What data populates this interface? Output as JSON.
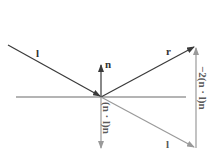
{
  "diagram": {
    "labels": {
      "incident": "l",
      "normal": "n",
      "reflected": "r",
      "projection": "(n · l)n",
      "incident_copy": "l",
      "double_projection": "−2(n · l)n"
    },
    "colors": {
      "primary": "#3a3a3a",
      "secondary": "#9a9a9a",
      "surface": "#6a6a6a",
      "background": "#ffffff"
    },
    "geometry": {
      "origin": [
        101,
        97
      ],
      "surface": {
        "x1": 16,
        "x2": 186,
        "y": 97
      },
      "incident_start": [
        8,
        45
      ],
      "normal_tip": [
        101,
        65
      ],
      "reflected_tip": [
        194,
        47
      ],
      "projection_tip": [
        101,
        148
      ],
      "incident_copy_tip": [
        194,
        148
      ],
      "double_projection": {
        "x": 196,
        "y_start": 148,
        "y_end": 47
      }
    }
  }
}
